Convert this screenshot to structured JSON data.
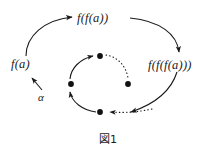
{
  "figure": {
    "caption": "図1",
    "background_color": "#ffffff",
    "ink_color": "#1a1a1a",
    "labels": {
      "a": "α",
      "f_a": "f(a)",
      "f_f_a": "f(f(a))",
      "f_f_f_a": "f(f(f(a)))"
    },
    "orbit": {
      "point_count": 4,
      "point_color": "#111111",
      "points": [
        {
          "name": "orbit-point-top",
          "x": 100,
          "y": 56
        },
        {
          "name": "orbit-point-right",
          "x": 128,
          "y": 84
        },
        {
          "name": "orbit-point-bottom",
          "x": 100,
          "y": 112
        },
        {
          "name": "orbit-point-left",
          "x": 71,
          "y": 84
        }
      ]
    },
    "edges": [
      {
        "name": "edge-alpha-to-fa",
        "from": "α",
        "to": "f(a)",
        "style": "solid",
        "shape": "straight",
        "arrow": true
      },
      {
        "name": "edge-fa-to-ffa",
        "from": "f(a)",
        "to": "f(f(a))",
        "style": "solid",
        "shape": "arc",
        "arrow": true
      },
      {
        "name": "edge-ffa-to-fffa",
        "from": "f(f(a))",
        "to": "f(f(f(a)))",
        "style": "solid",
        "shape": "arc",
        "arrow": true
      },
      {
        "name": "edge-fffa-to-orbit",
        "from": "f(f(f(a)))",
        "to": "orbit-point-bottom",
        "style": "solid",
        "shape": "arc",
        "arrow": true
      },
      {
        "name": "edge-orbit-bottom-to-left",
        "from": "orbit-point-bottom",
        "to": "orbit-point-left",
        "style": "solid",
        "shape": "arc",
        "arrow": true
      },
      {
        "name": "edge-orbit-left-to-top",
        "from": "orbit-point-left",
        "to": "orbit-point-top",
        "style": "solid",
        "shape": "arc",
        "arrow": true
      },
      {
        "name": "edge-orbit-top-to-right",
        "from": "orbit-point-top",
        "to": "orbit-point-right",
        "style": "dotted",
        "shape": "arc",
        "arrow": false
      },
      {
        "name": "edge-orbit-right-to-bottom",
        "from": "orbit-point-right",
        "to": "orbit-point-bottom",
        "style": "dotted",
        "shape": "arc",
        "arrow": true
      }
    ]
  }
}
